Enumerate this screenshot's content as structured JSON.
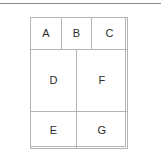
{
  "figure": {
    "type": "table-layout-diagram",
    "background_color": "#ffffff",
    "rule_color": "#8a8a8a",
    "border_color": "#b4b4b4",
    "text_color": "#2b2b2b"
  },
  "top_rule": {
    "name": "horizontal-divider"
  },
  "grid": {
    "rows": [
      {
        "name": "row-1",
        "cells": [
          {
            "id": "a",
            "label": "A"
          },
          {
            "id": "b",
            "label": "B"
          },
          {
            "id": "c",
            "label": "C"
          }
        ]
      },
      {
        "name": "row-2",
        "cells": [
          {
            "id": "d",
            "label": "D"
          },
          {
            "id": "f",
            "label": "F"
          }
        ]
      },
      {
        "name": "row-3",
        "cells": [
          {
            "id": "e",
            "label": "E"
          },
          {
            "id": "g",
            "label": "G"
          }
        ]
      }
    ]
  }
}
